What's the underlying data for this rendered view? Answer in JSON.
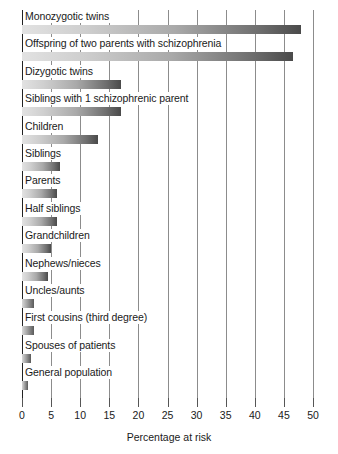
{
  "chart_data": {
    "type": "bar",
    "orientation": "horizontal",
    "title": "",
    "xlabel": "Percentage at risk",
    "ylabel": "",
    "xlim": [
      0,
      50
    ],
    "xticks": [
      0,
      5,
      10,
      15,
      20,
      25,
      30,
      35,
      40,
      45,
      50
    ],
    "xtick_labels": [
      "0",
      "5",
      "10",
      "15",
      "20",
      "25",
      "30",
      "35",
      "40",
      "45",
      "50"
    ],
    "grid": true,
    "grid_axis": "x",
    "legend": null,
    "categories": [
      "Monozygotic twins",
      "Offspring of two parents with schizophrenia",
      "Dizygotic twins",
      "Siblings with 1 schizophrenic parent",
      "Children",
      "Siblings",
      "Parents",
      "Half siblings",
      "Grandchildren",
      "Nephews/nieces",
      "Uncles/aunts",
      "First cousins (third degree)",
      "Spouses of patients",
      "General population"
    ],
    "values": [
      48,
      46.5,
      17,
      17,
      13,
      6.5,
      6,
      6,
      5,
      4.5,
      2,
      2,
      1.5,
      1
    ],
    "bar_style": {
      "gradient_from": "#e2e2e2",
      "gradient_to": "#4a4a4a"
    }
  },
  "axis": {
    "x_title": "Percentage at risk"
  }
}
